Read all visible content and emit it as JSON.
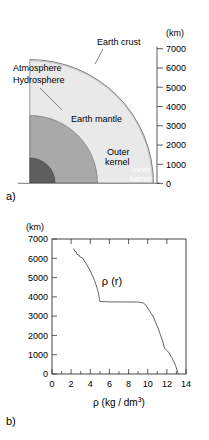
{
  "figure": {
    "panel_a_label": "a)",
    "panel_b_label": "b)"
  },
  "panel_a": {
    "unit_label": "(km)",
    "regions": [
      {
        "name": "Earth crust",
        "label": "Earth crust",
        "color": "#f2f2f2",
        "outer_radius_km": 6400
      },
      {
        "name": "Earth mantle",
        "label": "Earth mantle",
        "color": "#e8e8e8",
        "outer_radius_km": 6350
      },
      {
        "name": "Outer kernel",
        "label_line1": "Outer",
        "label_line2": "kernel",
        "color": "#a8a8a8",
        "outer_radius_km": 3500
      },
      {
        "name": "Inner kernel",
        "label_line1": "Inner",
        "label_line2": "kernel",
        "color": "#5e5e5e",
        "outer_radius_km": 1300
      }
    ],
    "callouts": [
      {
        "line1": "Atmosphere",
        "line2": "Hydrosphere"
      },
      {
        "line1": "Earth crust"
      }
    ],
    "axis": {
      "min": 0,
      "max": 7000,
      "step": 1000,
      "ticks": [
        "7000",
        "6000",
        "5000",
        "4000",
        "3000",
        "2000",
        "1000",
        "0"
      ]
    }
  },
  "chart_data": {
    "type": "line",
    "title": "",
    "xlabel": "ρ (kg / dm3)",
    "xlabel_base": "ρ (kg / dm",
    "xlabel_sup": "3",
    "xlabel_end": ")",
    "ylabel": "(km)",
    "annotation": "ρ (r)",
    "xlim": [
      0,
      14
    ],
    "ylim": [
      0,
      7000
    ],
    "xticks": [
      0,
      2,
      4,
      6,
      8,
      10,
      12,
      14
    ],
    "xtick_labels": [
      "0",
      "2",
      "4",
      "6",
      "8",
      "10",
      "12",
      "14"
    ],
    "xminor": [
      1,
      3,
      5,
      7,
      9,
      11,
      13
    ],
    "yticks": [
      0,
      1000,
      2000,
      3000,
      4000,
      5000,
      6000,
      7000
    ],
    "ytick_labels": [
      "0",
      "1000",
      "2000",
      "3000",
      "4000",
      "5000",
      "6000",
      "7000"
    ],
    "grid": false,
    "legend": "none",
    "series": [
      {
        "name": "ρ (r)",
        "x": [
          2.3,
          2.35,
          2.55,
          2.6,
          2.85,
          2.9,
          3.2,
          3.35,
          3.6,
          4.0,
          4.45,
          4.75,
          4.9,
          4.95,
          5.0,
          6.0,
          7.5,
          9.0,
          9.55,
          9.8,
          10.1,
          10.6,
          11.1,
          11.6,
          11.75,
          12.1,
          12.5,
          12.9,
          13.2
        ],
        "y": [
          6500,
          6380,
          6330,
          6210,
          6160,
          6080,
          6010,
          5880,
          5700,
          5350,
          4850,
          4400,
          4050,
          3880,
          3760,
          3740,
          3735,
          3730,
          3680,
          3570,
          3350,
          2950,
          2350,
          1650,
          1330,
          1180,
          870,
          450,
          0
        ]
      }
    ]
  }
}
